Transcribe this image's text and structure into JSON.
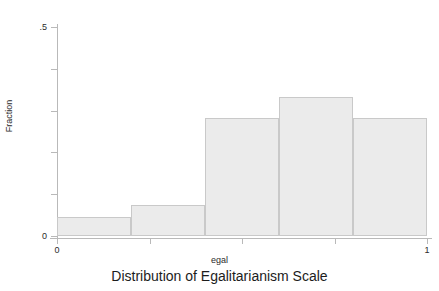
{
  "chart_data": {
    "type": "bar",
    "title": "Distribution of Egalitarianism Scale",
    "xlabel": "egal",
    "ylabel": "Fraction",
    "categories": [
      "0-0.2",
      "0.2-0.4",
      "0.4-0.6",
      "0.6-0.8",
      "0.8-1.0"
    ],
    "bin_edges": [
      0,
      0.2,
      0.4,
      0.6,
      0.8,
      1.0
    ],
    "values": [
      0.045,
      0.074,
      0.282,
      0.332,
      0.282
    ],
    "xlim": [
      0,
      1
    ],
    "ylim": [
      0,
      0.5
    ],
    "grid": false,
    "legend": null,
    "bar_color": "#ebebeb",
    "bar_edge_color": "#c9c9c9",
    "axis_color": "#b9b9b9",
    "x_ticks": [
      {
        "value": 0,
        "label": "0"
      },
      {
        "value": 0.25,
        "label": ""
      },
      {
        "value": 0.5,
        "label": ""
      },
      {
        "value": 0.75,
        "label": ""
      },
      {
        "value": 1,
        "label": "1"
      }
    ],
    "y_ticks": [
      {
        "value": 0,
        "label": "0"
      },
      {
        "value": 0.1,
        "label": ""
      },
      {
        "value": 0.2,
        "label": ""
      },
      {
        "value": 0.3,
        "label": ""
      },
      {
        "value": 0.4,
        "label": ""
      },
      {
        "value": 0.5,
        "label": ".5"
      }
    ]
  }
}
